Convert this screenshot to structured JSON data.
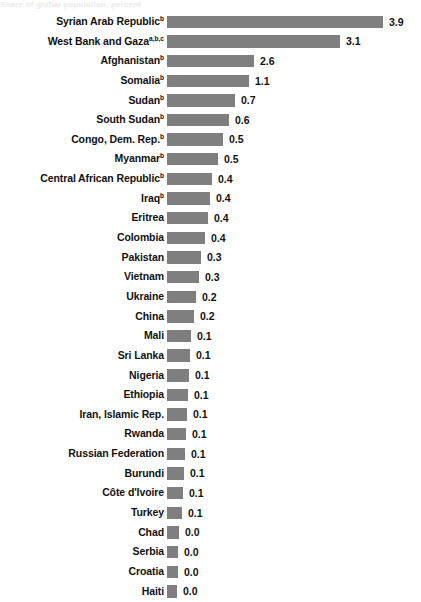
{
  "title_remnant": "Share of global population, percent",
  "chart_data": {
    "type": "bar",
    "orientation": "horizontal",
    "title": "",
    "subtitle": "",
    "xlabel": "",
    "ylabel": "",
    "grid": false,
    "legend": "none",
    "axis_visible": false,
    "bar_color": "#7f7f7f",
    "text_color": "#111111",
    "background_color": "#ffffff",
    "value_label_format": "one-decimal",
    "categories": [
      "Syrian Arab Republic",
      "West Bank and Gaza",
      "Afghanistan",
      "Somalia",
      "Sudan",
      "South Sudan",
      "Congo, Dem. Rep.",
      "Myanmar",
      "Central African Republic",
      "Iraq",
      "Eritrea",
      "Colombia",
      "Pakistan",
      "Vietnam",
      "Ukraine",
      "China",
      "Mali",
      "Sri Lanka",
      "Nigeria",
      "Ethiopia",
      "Iran, Islamic Rep.",
      "Rwanda",
      "Russian Federation",
      "Burundi",
      "Côte d'Ivoire",
      "Turkey",
      "Chad",
      "Serbia",
      "Croatia",
      "Haiti"
    ],
    "footnote_markers": [
      "b",
      "a,b,c",
      "b",
      "b",
      "b",
      "b",
      "b",
      "b",
      "b",
      "b",
      "",
      "",
      "",
      "",
      "",
      "",
      "",
      "",
      "",
      "",
      "",
      "",
      "",
      "",
      "",
      "",
      "",
      "",
      "",
      ""
    ],
    "values": [
      3.9,
      3.1,
      2.6,
      1.1,
      0.7,
      0.6,
      0.5,
      0.5,
      0.4,
      0.4,
      0.4,
      0.4,
      0.3,
      0.3,
      0.2,
      0.2,
      0.1,
      0.1,
      0.1,
      0.1,
      0.1,
      0.1,
      0.1,
      0.1,
      0.1,
      0.1,
      0.0,
      0.0,
      0.0,
      0.0
    ],
    "value_labels": [
      "3.9",
      "3.1",
      "2.6",
      "1.1",
      "0.7",
      "0.6",
      "0.5",
      "0.5",
      "0.4",
      "0.4",
      "0.4",
      "0.4",
      "0.3",
      "0.3",
      "0.2",
      "0.2",
      "0.1",
      "0.1",
      "0.1",
      "0.1",
      "0.1",
      "0.1",
      "0.1",
      "0.1",
      "0.1",
      "0.1",
      "0.0",
      "0.0",
      "0.0",
      "0.0"
    ],
    "bar_pixel_widths": [
      216,
      173,
      87,
      82,
      68,
      62,
      56,
      51,
      45,
      43,
      41,
      38,
      34,
      32,
      29,
      27,
      24,
      23,
      22,
      21,
      20,
      19,
      18,
      17,
      16,
      15,
      12,
      11,
      11,
      10
    ],
    "xlim": [
      0,
      3.9
    ]
  }
}
